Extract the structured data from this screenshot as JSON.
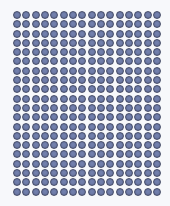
{
  "grid": {
    "columns": 16,
    "rows": 20,
    "dot_color": "#6d7ba8",
    "dot_border_color": "#454c68",
    "background": "#f7f8fb"
  }
}
